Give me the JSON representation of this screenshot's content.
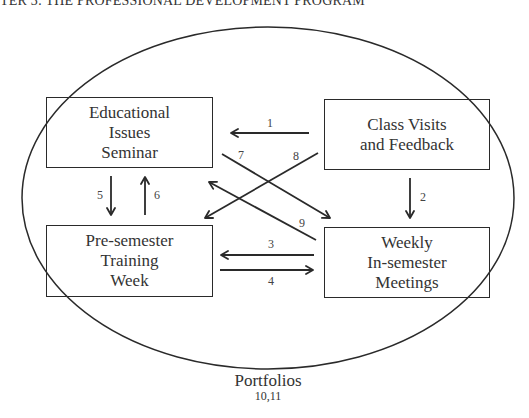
{
  "header": {
    "text": "TER 3: THE PROFESSIONAL DEVELOPMENT PROGRAM"
  },
  "container": {
    "label": "Portfolios",
    "sublabel": "10,11",
    "shape": "ellipse"
  },
  "nodes": [
    {
      "id": "educational-issues-seminar",
      "lines": [
        "Educational",
        "Issues",
        "Seminar"
      ]
    },
    {
      "id": "class-visits-feedback",
      "lines": [
        "Class Visits",
        "and Feedback"
      ]
    },
    {
      "id": "pre-semester-training-week",
      "lines": [
        "Pre-semester",
        "Training",
        "Week"
      ]
    },
    {
      "id": "weekly-in-semester-meetings",
      "lines": [
        "Weekly",
        "In-semester",
        "Meetings"
      ]
    }
  ],
  "edges": [
    {
      "label": "1",
      "from": "Class Visits and Feedback",
      "to": "Educational Issues Seminar"
    },
    {
      "label": "2",
      "from": "Class Visits and Feedback",
      "to": "Weekly In-semester Meetings"
    },
    {
      "label": "3",
      "from": "Weekly In-semester Meetings",
      "to": "Pre-semester Training Week"
    },
    {
      "label": "4",
      "from": "Pre-semester Training Week",
      "to": "Weekly In-semester Meetings"
    },
    {
      "label": "5",
      "from": "Educational Issues Seminar",
      "to": "Pre-semester Training Week"
    },
    {
      "label": "6",
      "from": "Pre-semester Training Week",
      "to": "Educational Issues Seminar"
    },
    {
      "label": "7",
      "from": "Educational Issues Seminar",
      "to": "Weekly In-semester Meetings"
    },
    {
      "label": "8",
      "from": "Class Visits and Feedback",
      "to": "Pre-semester Training Week"
    },
    {
      "label": "9",
      "from": "Weekly In-semester Meetings",
      "to": "Educational Issues Seminar"
    }
  ],
  "colors": {
    "stroke": "#2a2a2a",
    "text": "#333333",
    "background": "#ffffff"
  }
}
